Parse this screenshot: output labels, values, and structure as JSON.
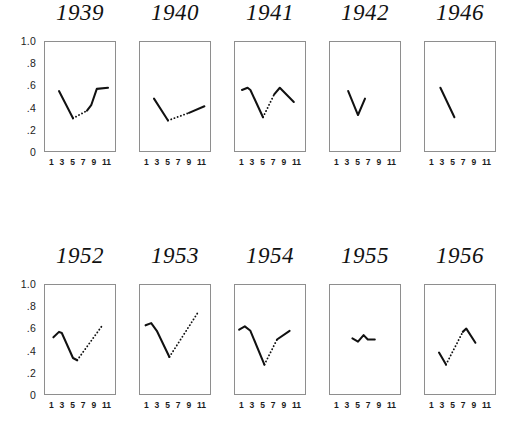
{
  "figure": {
    "background": "#ffffff",
    "line_color": "#111111",
    "box_color": "#8e8e8e"
  },
  "axes": {
    "y_ticks": [
      "1.0",
      ".8",
      ".6",
      ".4",
      ".2",
      "0"
    ],
    "y_min": 0,
    "y_max": 1.0,
    "x_ticks": [
      "1",
      "3",
      "5",
      "7",
      "9",
      "11"
    ],
    "x_min": 1,
    "x_max": 11
  },
  "chart_data": {
    "type": "line",
    "title": "",
    "xlabel": "",
    "ylabel": "",
    "ylim": [
      0,
      1.0
    ],
    "xlim": [
      1,
      11
    ],
    "grid": false,
    "legend": "none",
    "note": "Small-multiples of monthly series by year; solid segments are observed, dotted segments are interpolated/estimated.",
    "panels": [
      {
        "title": "1939",
        "row": 0,
        "segments": [
          {
            "style": "solid",
            "x": [
              3,
              5
            ],
            "y": [
              0.55,
              0.3
            ]
          },
          {
            "style": "dotted",
            "x": [
              5,
              7
            ],
            "y": [
              0.3,
              0.37
            ]
          },
          {
            "style": "solid",
            "x": [
              7,
              7.6,
              8.4,
              10
            ],
            "y": [
              0.37,
              0.42,
              0.57,
              0.58
            ]
          }
        ]
      },
      {
        "title": "1940",
        "row": 0,
        "segments": [
          {
            "style": "solid",
            "x": [
              3,
              5
            ],
            "y": [
              0.48,
              0.28
            ]
          },
          {
            "style": "dotted",
            "x": [
              5,
              8
            ],
            "y": [
              0.28,
              0.35
            ]
          },
          {
            "style": "solid",
            "x": [
              8,
              10.2
            ],
            "y": [
              0.35,
              0.41
            ]
          }
        ]
      },
      {
        "title": "1941",
        "row": 0,
        "segments": [
          {
            "style": "solid",
            "x": [
              2,
              2.8,
              3.2,
              5
            ],
            "y": [
              0.56,
              0.58,
              0.56,
              0.31
            ]
          },
          {
            "style": "dotted",
            "x": [
              5,
              6.6
            ],
            "y": [
              0.31,
              0.52
            ]
          },
          {
            "style": "solid",
            "x": [
              6.6,
              7.4,
              9.4
            ],
            "y": [
              0.52,
              0.58,
              0.45
            ]
          }
        ]
      },
      {
        "title": "1942",
        "row": 0,
        "segments": [
          {
            "style": "solid",
            "x": [
              3.6,
              5,
              6
            ],
            "y": [
              0.55,
              0.33,
              0.48
            ]
          }
        ]
      },
      {
        "title": "1946",
        "row": 0,
        "segments": [
          {
            "style": "solid",
            "x": [
              3.2,
              5.2
            ],
            "y": [
              0.58,
              0.31
            ]
          }
        ]
      },
      {
        "title": "1952",
        "row": 1,
        "segments": [
          {
            "style": "solid",
            "x": [
              2.2,
              3,
              3.4,
              5,
              5.6
            ],
            "y": [
              0.52,
              0.57,
              0.56,
              0.33,
              0.31
            ]
          },
          {
            "style": "dotted",
            "x": [
              5.6,
              9.2
            ],
            "y": [
              0.31,
              0.63
            ]
          }
        ]
      },
      {
        "title": "1953",
        "row": 1,
        "segments": [
          {
            "style": "solid",
            "x": [
              1.8,
              2.6,
              3.4,
              5.2
            ],
            "y": [
              0.63,
              0.65,
              0.58,
              0.34
            ]
          },
          {
            "style": "dotted",
            "x": [
              5.2,
              9.2
            ],
            "y": [
              0.34,
              0.74
            ]
          }
        ]
      },
      {
        "title": "1954",
        "row": 1,
        "segments": [
          {
            "style": "solid",
            "x": [
              1.6,
              2.4,
              3.2,
              5.2
            ],
            "y": [
              0.59,
              0.62,
              0.58,
              0.27
            ]
          },
          {
            "style": "dotted",
            "x": [
              5.2,
              7.0
            ],
            "y": [
              0.27,
              0.5
            ]
          },
          {
            "style": "solid",
            "x": [
              7.0,
              8.8
            ],
            "y": [
              0.5,
              0.58
            ]
          }
        ]
      },
      {
        "title": "1955",
        "row": 1,
        "segments": [
          {
            "style": "solid",
            "x": [
              4.2,
              5.0,
              5.8,
              6.4,
              7.4
            ],
            "y": [
              0.51,
              0.48,
              0.54,
              0.5,
              0.5
            ]
          }
        ]
      },
      {
        "title": "1956",
        "row": 1,
        "segments": [
          {
            "style": "solid",
            "x": [
              3.0,
              4.0
            ],
            "y": [
              0.38,
              0.27
            ]
          },
          {
            "style": "dotted",
            "x": [
              4.0,
              6.4
            ],
            "y": [
              0.27,
              0.57
            ]
          },
          {
            "style": "solid",
            "x": [
              6.4,
              6.9,
              8.2
            ],
            "y": [
              0.57,
              0.6,
              0.47
            ]
          }
        ]
      }
    ]
  }
}
